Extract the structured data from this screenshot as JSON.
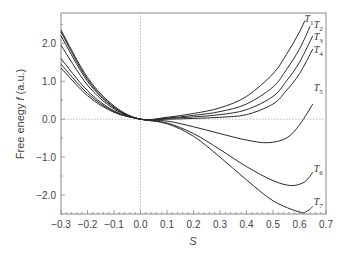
{
  "chart_data": {
    "type": "line",
    "title": "",
    "xlabel": "S",
    "ylabel": "Free enegy f (a.u.)",
    "xlim": [
      -0.3,
      0.7
    ],
    "ylim": [
      -2.5,
      2.8
    ],
    "xticks": [
      "-0.3",
      "-0.2",
      "-0.1",
      "0.0",
      "0.1",
      "0.2",
      "0.3",
      "0.4",
      "0.5",
      "0.6",
      "0.7"
    ],
    "yticks": [
      "2.0",
      "1.0",
      "0.0",
      "-1.0",
      "-2.0"
    ],
    "grid": false,
    "reference_lines": {
      "x0": 0.0,
      "y0": 0.0,
      "style": "dotted"
    },
    "legend": "inline labels at curve ends",
    "series": [
      {
        "name": "T1",
        "x": [
          -0.3,
          -0.2,
          -0.1,
          0.0,
          0.1,
          0.2,
          0.3,
          0.4,
          0.5,
          0.55,
          0.6,
          0.62
        ],
        "y": [
          2.35,
          1.1,
          0.35,
          0.0,
          0.05,
          0.15,
          0.3,
          0.6,
          1.2,
          1.7,
          2.3,
          2.6
        ]
      },
      {
        "name": "T2",
        "x": [
          -0.3,
          -0.2,
          -0.1,
          0.0,
          0.1,
          0.2,
          0.3,
          0.4,
          0.5,
          0.55,
          0.6,
          0.64
        ],
        "y": [
          2.3,
          1.05,
          0.32,
          0.0,
          0.03,
          0.1,
          0.2,
          0.4,
          0.85,
          1.3,
          1.85,
          2.45
        ]
      },
      {
        "name": "T3",
        "x": [
          -0.3,
          -0.2,
          -0.1,
          0.0,
          0.1,
          0.2,
          0.3,
          0.4,
          0.5,
          0.55,
          0.6,
          0.65
        ],
        "y": [
          2.2,
          1.0,
          0.3,
          0.0,
          0.02,
          0.06,
          0.12,
          0.25,
          0.6,
          1.0,
          1.5,
          2.2
        ]
      },
      {
        "name": "T4",
        "x": [
          -0.3,
          -0.2,
          -0.1,
          0.0,
          0.1,
          0.2,
          0.3,
          0.4,
          0.5,
          0.55,
          0.6,
          0.65
        ],
        "y": [
          1.95,
          0.9,
          0.27,
          0.0,
          0.0,
          0.02,
          0.05,
          0.12,
          0.4,
          0.75,
          1.2,
          1.85
        ]
      },
      {
        "name": "T5",
        "x": [
          -0.3,
          -0.2,
          -0.1,
          0.0,
          0.1,
          0.2,
          0.3,
          0.4,
          0.48,
          0.55,
          0.6,
          0.65
        ],
        "y": [
          1.6,
          0.75,
          0.22,
          0.0,
          -0.05,
          -0.2,
          -0.38,
          -0.55,
          -0.62,
          -0.5,
          -0.15,
          0.4
        ]
      },
      {
        "name": "T6",
        "x": [
          -0.3,
          -0.2,
          -0.1,
          0.0,
          0.1,
          0.2,
          0.3,
          0.4,
          0.5,
          0.57,
          0.62,
          0.65
        ],
        "y": [
          1.45,
          0.68,
          0.2,
          0.0,
          -0.1,
          -0.38,
          -0.8,
          -1.25,
          -1.62,
          -1.75,
          -1.65,
          -1.4
        ]
      },
      {
        "name": "T7",
        "x": [
          -0.3,
          -0.2,
          -0.1,
          0.0,
          0.1,
          0.2,
          0.3,
          0.4,
          0.5,
          0.6,
          0.63,
          0.65
        ],
        "y": [
          1.35,
          0.62,
          0.18,
          0.0,
          -0.12,
          -0.45,
          -1.0,
          -1.6,
          -2.15,
          -2.45,
          -2.42,
          -2.3
        ]
      }
    ],
    "labels": [
      {
        "text": "T",
        "sub": "1",
        "x": 0.615,
        "y": 2.55
      },
      {
        "text": "T",
        "sub": "2",
        "x": 0.65,
        "y": 2.4
      },
      {
        "text": "T",
        "sub": "3",
        "x": 0.65,
        "y": 2.1
      },
      {
        "text": "T",
        "sub": "4",
        "x": 0.65,
        "y": 1.75
      },
      {
        "text": "T",
        "sub": "5",
        "x": 0.65,
        "y": 0.75
      },
      {
        "text": "T",
        "sub": "6",
        "x": 0.65,
        "y": -1.4
      },
      {
        "text": "T",
        "sub": "7",
        "x": 0.65,
        "y": -2.25
      }
    ]
  },
  "axes": {
    "xlabel": "S",
    "ylabel_prefix": "Free enegy ",
    "ylabel_var": "f",
    "ylabel_suffix": " (a.u.)"
  },
  "colors": {
    "axis": "#888888",
    "curve": "#2a2a2a",
    "refline": "#bbbbbb",
    "text": "#444444"
  }
}
